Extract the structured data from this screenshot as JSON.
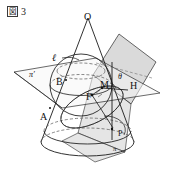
{
  "figure": {
    "caption": {
      "box_char": "図",
      "number": "3"
    },
    "colors": {
      "stroke": "#1a1a1a",
      "plane_fill": "#c9c9c9",
      "plane_fill_light": "#dcdcdc",
      "hidden_stroke": "#555555",
      "background": "#ffffff"
    },
    "labels": [
      {
        "name": "apex-O",
        "text": "O",
        "x": 84,
        "y": 12,
        "style": "lab"
      },
      {
        "name": "line-l",
        "text": "ℓ",
        "x": 52,
        "y": 53,
        "style": "lab ital"
      },
      {
        "name": "plane-pi-prime",
        "text": "π′",
        "x": 29,
        "y": 71,
        "style": "lab sm ital"
      },
      {
        "name": "point-B",
        "text": "B",
        "x": 56,
        "y": 77,
        "style": "lab"
      },
      {
        "name": "point-M",
        "text": "M",
        "x": 100,
        "y": 80,
        "style": "lab"
      },
      {
        "name": "angle-theta",
        "text": "θ",
        "x": 118,
        "y": 73,
        "style": "lab sm ital"
      },
      {
        "name": "point-H",
        "text": "H",
        "x": 130,
        "y": 81,
        "style": "lab"
      },
      {
        "name": "point-F",
        "text": "F",
        "x": 86,
        "y": 92,
        "style": "lab"
      },
      {
        "name": "point-A",
        "text": "A",
        "x": 40,
        "y": 112,
        "style": "lab"
      },
      {
        "name": "point-P",
        "text": "P",
        "x": 118,
        "y": 130,
        "style": "lab sm"
      },
      {
        "name": "plane-pi",
        "text": "π",
        "x": 113,
        "y": 146,
        "style": "lab xsm ital"
      }
    ],
    "elements": {
      "cone": "cone with apex O and elliptical base",
      "sphere": "inscribed sphere tangent to cone and cutting plane",
      "plane_pi": "tilted cutting plane labelled pi",
      "plane_pi_prime": "horizontal plane labelled pi-prime",
      "line_l": "line l in plane pi-prime",
      "angle_theta": "angle theta at point M between plane pi and line MH"
    }
  }
}
